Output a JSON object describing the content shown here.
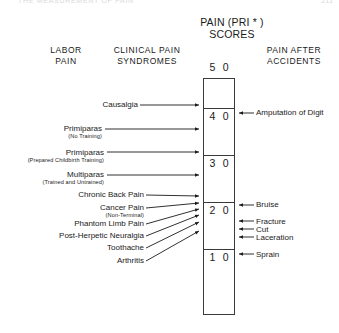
{
  "page": {
    "running_head_left": "THE MEASUREMENT OF PAIN",
    "running_head_right": "211"
  },
  "title": {
    "line1": "PAIN (PRI * )",
    "line2": "SCORES"
  },
  "column_headers": {
    "left": {
      "line1": "LABOR",
      "line2": "PAIN"
    },
    "middle": {
      "line1": "CLINICAL PAIN",
      "line2": "SYNDROMES"
    },
    "right": {
      "line1": "PAIN  AFTER",
      "line2": "ACCIDENTS"
    }
  },
  "scale": {
    "ticks": [
      {
        "value": "5 0",
        "y": 63,
        "has_line": false
      },
      {
        "value": "4 0",
        "y": 108,
        "has_line": true
      },
      {
        "value": "3 0",
        "y": 155,
        "has_line": true
      },
      {
        "value": "2 0",
        "y": 202,
        "has_line": true
      },
      {
        "value": "1 0",
        "y": 249,
        "has_line": true
      }
    ]
  },
  "labor_pain_labels": [
    {
      "name": "Primiparas",
      "sub": "(No Training)"
    },
    {
      "name": "Primiparas",
      "sub": "(Prepared Childbirth Training)"
    },
    {
      "name": "Multiparas",
      "sub": "(Trained and Untrained)"
    }
  ],
  "clinical_pain_labels": [
    {
      "name": "Causalgia",
      "sub": ""
    },
    {
      "name": "Chronic Back Pain",
      "sub": ""
    },
    {
      "name": "Cancer Pain",
      "sub": "(Non-Terminal)"
    },
    {
      "name": "Phantom Limb Pain",
      "sub": ""
    },
    {
      "name": "Post-Herpetic Neuralgia",
      "sub": ""
    },
    {
      "name": "Toothache",
      "sub": ""
    },
    {
      "name": "Arthritis",
      "sub": ""
    }
  ],
  "accident_pain_labels": [
    {
      "name": "Amputation of Digit"
    },
    {
      "name": "Bruise"
    },
    {
      "name": "Fracture"
    },
    {
      "name": "Cut"
    },
    {
      "name": "Laceration"
    },
    {
      "name": "Sprain"
    }
  ],
  "colors": {
    "ink": "#1a1a1a",
    "rule": "#3a3a3a",
    "background": "#ffffff"
  }
}
